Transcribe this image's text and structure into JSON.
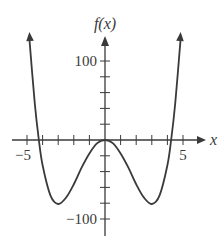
{
  "chart_data": {
    "type": "line",
    "title": "",
    "xlabel": "x",
    "ylabel": "f(x)",
    "function_description": "Quartic with double-well shape, approx f(x) = x^4 - 18x^2",
    "xlim": [
      -5,
      5
    ],
    "ylim": [
      -100,
      100
    ],
    "x_tick_step": 1,
    "y_tick_step": 20,
    "x_tick_labels": [
      {
        "value": -5,
        "label": "−5"
      },
      {
        "value": 5,
        "label": "5"
      }
    ],
    "y_tick_labels": [
      {
        "value": 100,
        "label": "100"
      },
      {
        "value": -100,
        "label": "−100"
      }
    ],
    "grid": false,
    "legend": null,
    "key_points": [
      {
        "x": -4.24,
        "y": 0,
        "note": "root"
      },
      {
        "x": -3,
        "y": -81,
        "note": "local minimum"
      },
      {
        "x": 0,
        "y": 0,
        "note": "local maximum"
      },
      {
        "x": 3,
        "y": -81,
        "note": "local minimum"
      },
      {
        "x": 4.24,
        "y": 0,
        "note": "root"
      }
    ],
    "series": [
      {
        "name": "f(x)",
        "x": [
          -4.85,
          -4.5,
          -4.24,
          -4.0,
          -3.5,
          -3.0,
          -2.5,
          -2.0,
          -1.5,
          -1.0,
          -0.5,
          0,
          0.5,
          1.0,
          1.5,
          2.0,
          2.5,
          3.0,
          3.5,
          4.0,
          4.24,
          4.5,
          4.85
        ],
        "values": [
          129,
          46,
          0,
          -32,
          -70,
          -81,
          -73,
          -56,
          -35,
          -17,
          -4,
          0,
          -4,
          -17,
          -35,
          -56,
          -73,
          -81,
          -70,
          -32,
          0,
          46,
          129
        ]
      }
    ],
    "curve_ends_with_arrows": true
  },
  "colors": {
    "axis": "#3a3a3a",
    "curve": "#3a3a3a",
    "background": "#ffffff"
  }
}
